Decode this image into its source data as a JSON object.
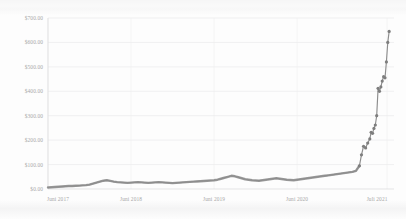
{
  "chart_data": {
    "type": "line",
    "title": "",
    "subtitle": "",
    "xlabel": "",
    "ylabel": "",
    "grid": true,
    "legend": false,
    "legend_position": "none",
    "line_color": "#8d8d8d",
    "marker_color": "#7e7e7e",
    "background_color": "#fdfdfd",
    "grid_color": "#e8e8ea",
    "ylim": [
      0,
      700
    ],
    "ytick_labels": [
      "$700.00",
      "$600.00",
      "$500.00",
      "$400.00",
      "$300.00",
      "$200.00",
      "$100.00",
      "$0.00"
    ],
    "ytick_values": [
      700,
      600,
      500,
      400,
      300,
      200,
      100,
      0
    ],
    "xtick_labels": [
      "Juni 2017",
      "Juni 2018",
      "Juni 2019",
      "Juni 2020",
      "Juli 2021"
    ],
    "xtick_positions": [
      0,
      12,
      24,
      36,
      49
    ],
    "xlim": [
      0,
      50
    ],
    "x": [
      0,
      0.5,
      1,
      1.5,
      2,
      2.5,
      3,
      3.5,
      4,
      4.5,
      5,
      5.5,
      6,
      6.5,
      7,
      7.5,
      8,
      8.5,
      9,
      9.5,
      10,
      10.5,
      11,
      11.5,
      12,
      12.5,
      13,
      13.5,
      14,
      14.5,
      15,
      15.5,
      16,
      16.5,
      17,
      17.5,
      18,
      18.5,
      19,
      19.5,
      20,
      20.5,
      21,
      21.5,
      22,
      22.5,
      23,
      23.5,
      24,
      24.5,
      25,
      25.5,
      26,
      26.5,
      27,
      27.5,
      28,
      28.5,
      29,
      29.5,
      30,
      30.5,
      31,
      31.5,
      32,
      32.5,
      33,
      33.5,
      34,
      34.5,
      35,
      35.5,
      36,
      36.5,
      37,
      37.5,
      38,
      38.5,
      39,
      39.5,
      40,
      40.5,
      41,
      41.5,
      42,
      42.5,
      43,
      43.5,
      44,
      44.5,
      45,
      45.3,
      45.6,
      45.9,
      46.2,
      46.5,
      46.7,
      46.9,
      47.1,
      47.3,
      47.5,
      47.7,
      47.9,
      48.1,
      48.3,
      48.5,
      48.7,
      48.9,
      49.1,
      49.3
    ],
    "values": [
      6,
      7,
      8,
      9,
      10,
      11,
      12,
      12,
      13,
      14,
      15,
      16,
      18,
      22,
      26,
      30,
      34,
      36,
      33,
      30,
      28,
      27,
      26,
      25,
      26,
      27,
      28,
      27,
      26,
      25,
      26,
      27,
      28,
      27,
      26,
      25,
      24,
      25,
      26,
      27,
      28,
      29,
      30,
      31,
      32,
      33,
      34,
      35,
      36,
      38,
      42,
      46,
      50,
      54,
      52,
      48,
      44,
      40,
      38,
      36,
      35,
      34,
      36,
      38,
      40,
      42,
      44,
      42,
      40,
      38,
      37,
      36,
      38,
      40,
      42,
      44,
      46,
      48,
      50,
      52,
      54,
      56,
      58,
      60,
      62,
      64,
      66,
      68,
      70,
      74,
      95,
      140,
      175,
      168,
      188,
      205,
      232,
      228,
      248,
      262,
      300,
      412,
      400,
      418,
      442,
      460,
      455,
      520,
      600,
      645
    ],
    "peak_value": 645,
    "peak_label": "$645.00",
    "start_value": 6,
    "series_name": "price"
  },
  "axis": {
    "y_axis_name": "y-axis",
    "x_axis_name": "x-axis"
  }
}
